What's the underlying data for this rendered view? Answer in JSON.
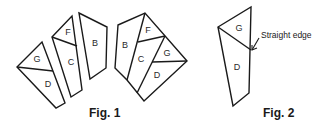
{
  "figures": [
    {
      "caption": "Fig. 1",
      "separate_pieces": [
        {
          "labels": [
            "G",
            "D"
          ]
        },
        {
          "labels": [
            "F",
            "C"
          ]
        },
        {
          "labels": [
            "B"
          ]
        }
      ],
      "assembled_labels": [
        "B",
        "F",
        "C",
        "G",
        "D"
      ]
    },
    {
      "caption": "Fig. 2",
      "labels": [
        "G",
        "D"
      ],
      "annotation": "Straight edge"
    }
  ],
  "colors": {
    "line": "#1a1a1a",
    "background": "#ffffff"
  }
}
